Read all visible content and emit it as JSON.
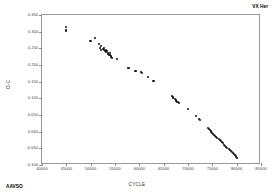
{
  "chart_data": {
    "type": "scatter",
    "title": "",
    "xlabel": "CYCLE",
    "ylabel": "O-C",
    "xlim": [
      40000,
      85000
    ],
    "ylim": [
      -0.1,
      0.35
    ],
    "grid": false,
    "legend_position": "none",
    "xticks": [
      40000,
      45000,
      50000,
      55000,
      60000,
      65000,
      70000,
      75000,
      80000,
      85000
    ],
    "xtick_labels": [
      "40000",
      "45000",
      "50000",
      "55000",
      "60000",
      "65000",
      "70000",
      "75000",
      "80000",
      "85000"
    ],
    "yticks": [
      -0.1,
      -0.05,
      0.0,
      0.05,
      0.1,
      0.15,
      0.2,
      0.25,
      0.3,
      0.35
    ],
    "ytick_labels": [
      "-0.100",
      "-0.050",
      "0.000",
      "0.050",
      "0.100",
      "0.150",
      "0.200",
      "0.250",
      "0.300",
      "0.350"
    ],
    "annotations": [
      {
        "name": "star-name",
        "text": "VX Her",
        "position": "top-right"
      },
      {
        "name": "data-source",
        "text": "AAVSO",
        "position": "bottom-left"
      }
    ],
    "series": [
      {
        "name": "O-C residuals",
        "color": "#111111",
        "marker": "circle",
        "points": [
          [
            44900,
            0.313
          ],
          [
            44950,
            0.306
          ],
          [
            44980,
            0.303
          ],
          [
            49900,
            0.272
          ],
          [
            50150,
            0.271
          ],
          [
            50900,
            0.281
          ],
          [
            51700,
            0.262
          ],
          [
            51900,
            0.25
          ],
          [
            52050,
            0.246
          ],
          [
            52100,
            0.256
          ],
          [
            52600,
            0.248
          ],
          [
            52750,
            0.251
          ],
          [
            52800,
            0.244
          ],
          [
            53000,
            0.242
          ],
          [
            53150,
            0.245
          ],
          [
            53250,
            0.238
          ],
          [
            53400,
            0.241
          ],
          [
            53500,
            0.236
          ],
          [
            53600,
            0.233
          ],
          [
            53750,
            0.231
          ],
          [
            53900,
            0.229
          ],
          [
            54000,
            0.235
          ],
          [
            54100,
            0.227
          ],
          [
            54250,
            0.224
          ],
          [
            54400,
            0.222
          ],
          [
            55400,
            0.219
          ],
          [
            57600,
            0.191
          ],
          [
            57900,
            0.19
          ],
          [
            59200,
            0.182
          ],
          [
            59400,
            0.183
          ],
          [
            60400,
            0.178
          ],
          [
            60550,
            0.177
          ],
          [
            61700,
            0.164
          ],
          [
            62900,
            0.152
          ],
          [
            63000,
            0.151
          ],
          [
            66700,
            0.106
          ],
          [
            66900,
            0.104
          ],
          [
            67000,
            0.102
          ],
          [
            67300,
            0.098
          ],
          [
            67500,
            0.095
          ],
          [
            67600,
            0.092
          ],
          [
            67750,
            0.09
          ],
          [
            67900,
            0.088
          ],
          [
            68050,
            0.087
          ],
          [
            70100,
            0.068
          ],
          [
            71600,
            0.046
          ],
          [
            72300,
            0.038
          ],
          [
            72450,
            0.036
          ],
          [
            74100,
            0.011
          ],
          [
            74300,
            0.009
          ],
          [
            74500,
            0.005
          ],
          [
            74650,
            0.002
          ],
          [
            74800,
            -0.001
          ],
          [
            75000,
            -0.004
          ],
          [
            75200,
            -0.007
          ],
          [
            75400,
            -0.01
          ],
          [
            75600,
            -0.013
          ],
          [
            75800,
            -0.016
          ],
          [
            76000,
            -0.019
          ],
          [
            76300,
            -0.023
          ],
          [
            76500,
            -0.026
          ],
          [
            76700,
            -0.029
          ],
          [
            76900,
            -0.032
          ],
          [
            77100,
            -0.035
          ],
          [
            77400,
            -0.039
          ],
          [
            77700,
            -0.043
          ],
          [
            77900,
            -0.046
          ],
          [
            78100,
            -0.049
          ],
          [
            78400,
            -0.053
          ],
          [
            78600,
            -0.056
          ],
          [
            78800,
            -0.059
          ],
          [
            79000,
            -0.062
          ],
          [
            79200,
            -0.065
          ],
          [
            79400,
            -0.068
          ],
          [
            79600,
            -0.071
          ],
          [
            79800,
            -0.074
          ],
          [
            79950,
            -0.077
          ],
          [
            80050,
            -0.079
          ]
        ]
      }
    ]
  }
}
